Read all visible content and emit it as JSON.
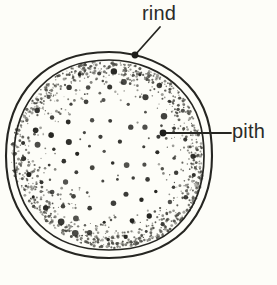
{
  "figure": {
    "background_color": "#fdfdf8",
    "ink_color": "#2b2b28"
  },
  "labels": {
    "rind": {
      "text": "rind",
      "x": 142,
      "y": 3
    },
    "pith": {
      "text": "pith",
      "x": 232,
      "y": 121
    }
  },
  "leaders": {
    "rind": {
      "from_x": 160,
      "from_y": 27,
      "to_x": 135,
      "to_y": 55,
      "dot_x": 135,
      "dot_y": 55,
      "dot_r": 3.4
    },
    "pith": {
      "from_x": 231,
      "from_y": 133,
      "to_x": 163,
      "to_y": 133,
      "dot_x": 163,
      "dot_y": 133,
      "dot_r": 3.4
    }
  },
  "shape": {
    "type": "irregular-circle",
    "center_x": 109,
    "center_y": 155,
    "outer_radius_x": 103,
    "outer_radius_y": 103,
    "inner_radius_x": 95,
    "inner_radius_y": 95,
    "outer_path": "M 109,52 C 139,52 168,64 188,85 C 207,105 212,129 212,156 C 212,184 203,211 184,231 C 164,250 138,258 109,258 C 80,258 53,250 34,231 C 15,211 6,184 6,156 C 6,128 14,101 34,80 C 54,60 80,52 109,52 Z",
    "inner_path": "M 109,60 C 137,60 163,71 181,90 C 199,109 204,131 204,156 C 204,182 196,207 178,225 C 160,243 136,250 109,250 C 82,250 58,243 40,225 C 22,207 14,182 14,156 C 14,130 22,106 40,87 C 58,68 82,60 109,60 Z"
  },
  "stipple": {
    "description": "dense fine stipple near rim fading toward center, with scattered larger dots",
    "fine_dot_count": 2400,
    "large_dot_count": 150
  },
  "chart_data": {
    "type": "diagram",
    "parts": [
      {
        "name": "rind",
        "description": "outer double-line boundary layer"
      },
      {
        "name": "pith",
        "description": "inner stippled tissue with scattered vascular bundles"
      }
    ]
  }
}
